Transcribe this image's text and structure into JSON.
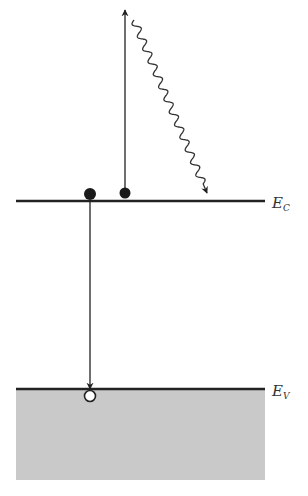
{
  "diagram": {
    "type": "semiconductor-band-diagram",
    "levels": {
      "conduction_band": {
        "symbol": "E",
        "subscript": "C",
        "y": 201
      },
      "valence_band": {
        "symbol": "E",
        "subscript": "V",
        "y": 389
      }
    },
    "particles": [
      {
        "kind": "electron",
        "fill": "#1a1a1a",
        "x": 90,
        "y": 194,
        "r": 6
      },
      {
        "kind": "electron",
        "fill": "#1a1a1a",
        "x": 125,
        "y": 193,
        "r": 5.5
      },
      {
        "kind": "hole",
        "fill": "#ffffff",
        "x": 90,
        "y": 396,
        "r": 6
      }
    ],
    "arrows": [
      {
        "kind": "excitation",
        "from": [
          125,
          188
        ],
        "to": [
          125,
          10
        ]
      },
      {
        "kind": "recombination",
        "from": [
          90,
          200
        ],
        "to": [
          90,
          389
        ]
      }
    ],
    "wavy_arrow": {
      "kind": "relaxation",
      "from": [
        134,
        20
      ],
      "to": [
        207,
        193
      ],
      "waves": 13,
      "amplitude": 3.5
    },
    "valence_fill_color": "#c9c9c9",
    "line_color": "#222222"
  }
}
